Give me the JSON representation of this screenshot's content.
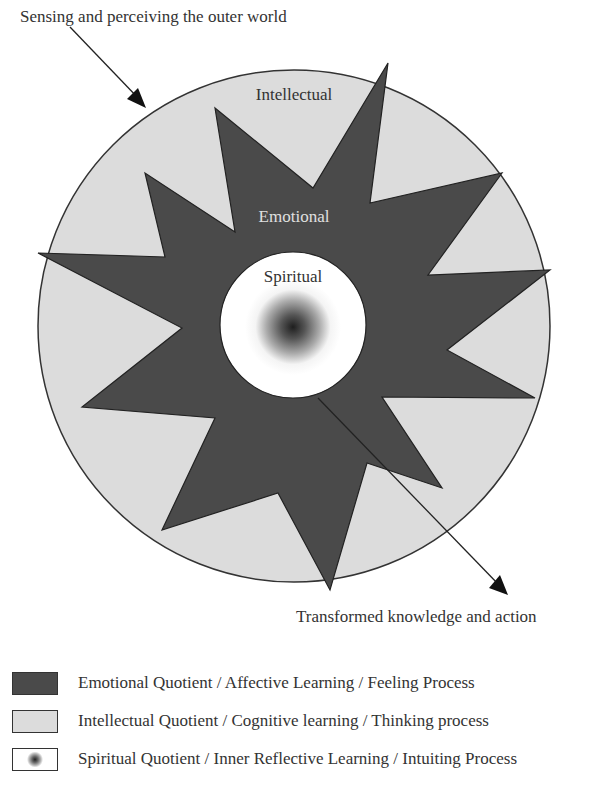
{
  "diagram": {
    "annotations": {
      "input_arrow_label": "Sensing and perceiving the outer world",
      "output_arrow_label": "Transformed knowledge and action"
    },
    "layers": {
      "outer": "Intellectual",
      "middle": "Emotional",
      "inner": "Spiritual"
    },
    "colors": {
      "intellectual_fill": "#dcdcdc",
      "emotional_fill": "#4a4a4a",
      "spiritual_fill": "#ffffff",
      "outline": "#333333"
    }
  },
  "legend": {
    "items": [
      {
        "key": "emotional",
        "label": "Emotional Quotient / Affective Learning / Feeling Process"
      },
      {
        "key": "intellectual",
        "label": "Intellectual Quotient / Cognitive learning / Thinking process"
      },
      {
        "key": "spiritual",
        "label": "Spiritual Quotient / Inner Reflective Learning / Intuiting Process"
      }
    ]
  }
}
